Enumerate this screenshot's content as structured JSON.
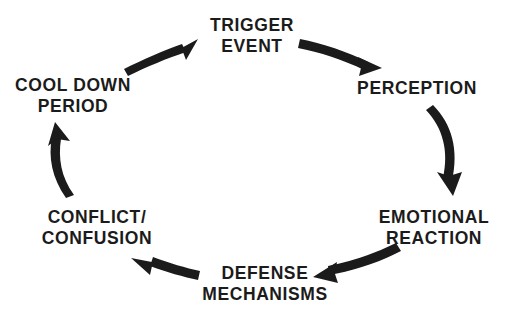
{
  "diagram": {
    "type": "cycle-diagram",
    "direction": "clockwise",
    "background_color": "#ffffff",
    "text_color": "#1b1b1b",
    "arrow_color": "#1b1b1b",
    "nodes": [
      {
        "id": "trigger-event",
        "lines": [
          "TRIGGER",
          "EVENT"
        ],
        "line1": "TRIGGER",
        "line2": "EVENT",
        "x": 252,
        "y": 35,
        "position": "top"
      },
      {
        "id": "perception",
        "lines": [
          "PERCEPTION"
        ],
        "line1": "PERCEPTION",
        "line2": "",
        "x": 417,
        "y": 88,
        "position": "top-right"
      },
      {
        "id": "emotional-reaction",
        "lines": [
          "EMOTIONAL",
          "REACTION"
        ],
        "line1": "EMOTIONAL",
        "line2": "REACTION",
        "x": 434,
        "y": 227,
        "position": "bottom-right"
      },
      {
        "id": "defense-mechanisms",
        "lines": [
          "DEFENSE",
          "MECHANISMS"
        ],
        "line1": "DEFENSE",
        "line2": "MECHANISMS",
        "x": 265,
        "y": 283,
        "position": "bottom"
      },
      {
        "id": "conflict-confusion",
        "lines": [
          "CONFLICT/",
          "CONFUSION"
        ],
        "line1": "CONFLICT/",
        "line2": "CONFUSION",
        "x": 97,
        "y": 227,
        "position": "bottom-left"
      },
      {
        "id": "cool-down-period",
        "lines": [
          "COOL DOWN",
          "PERIOD"
        ],
        "line1": "COOL DOWN",
        "line2": "PERIOD",
        "x": 73,
        "y": 95,
        "position": "top-left"
      }
    ],
    "arrows": [
      {
        "id": "cool-down-to-trigger",
        "from": "cool-down-period",
        "to": "trigger-event"
      },
      {
        "id": "trigger-to-perception",
        "from": "trigger-event",
        "to": "perception"
      },
      {
        "id": "perception-to-emotional",
        "from": "perception",
        "to": "emotional-reaction"
      },
      {
        "id": "emotional-to-defense",
        "from": "emotional-reaction",
        "to": "defense-mechanisms"
      },
      {
        "id": "defense-to-conflict",
        "from": "defense-mechanisms",
        "to": "conflict-confusion"
      },
      {
        "id": "conflict-to-cool-down",
        "from": "conflict-confusion",
        "to": "cool-down-period"
      }
    ]
  }
}
